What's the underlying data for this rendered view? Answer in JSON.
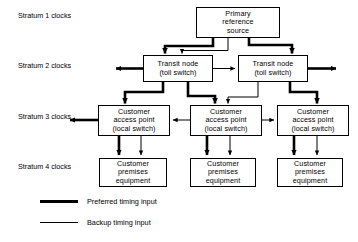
{
  "figure": {
    "background_color": "#ffffff",
    "line_color": "#000000"
  },
  "strata": [
    {
      "id": "stratum-1",
      "label_line1": "Stratum 1",
      "label_line2": "clocks",
      "x": 18,
      "y": 12
    },
    {
      "id": "stratum-2",
      "label_line1": "Stratum 2",
      "label_line2": "clocks",
      "x": 18,
      "y": 62
    },
    {
      "id": "stratum-3",
      "label_line1": "Stratum 3",
      "label_line2": "clocks",
      "x": 18,
      "y": 113
    },
    {
      "id": "stratum-4",
      "label_line1": "Stratum 4",
      "label_line2": "clocks",
      "x": 18,
      "y": 163
    }
  ],
  "nodes": [
    {
      "id": "primary-reference-source",
      "lines": [
        "Primary",
        "reference",
        "source"
      ],
      "x": 196,
      "y": 7,
      "w": 84,
      "h": 31
    },
    {
      "id": "transit-node-left",
      "lines": [
        "Transit node",
        "(toll switch)"
      ],
      "x": 143,
      "y": 55,
      "w": 70,
      "h": 27
    },
    {
      "id": "transit-node-right",
      "lines": [
        "Transit node",
        "(toll switch)"
      ],
      "x": 238,
      "y": 55,
      "w": 70,
      "h": 27
    },
    {
      "id": "customer-access-point-left",
      "lines": [
        "Customer",
        "access point",
        "(local switch)"
      ],
      "x": 98,
      "y": 105,
      "w": 72,
      "h": 31
    },
    {
      "id": "customer-access-point-center",
      "lines": [
        "Customer",
        "access point",
        "(local switch)"
      ],
      "x": 190,
      "y": 105,
      "w": 72,
      "h": 31
    },
    {
      "id": "customer-access-point-right",
      "lines": [
        "Customer",
        "access point",
        "(local switch)"
      ],
      "x": 277,
      "y": 105,
      "w": 72,
      "h": 31
    },
    {
      "id": "customer-premises-equipment-left",
      "lines": [
        "Customer",
        "premises",
        "equipment"
      ],
      "x": 99,
      "y": 158,
      "w": 68,
      "h": 29
    },
    {
      "id": "customer-premises-equipment-center",
      "lines": [
        "Customer",
        "premises",
        "equipment"
      ],
      "x": 190,
      "y": 158,
      "w": 66,
      "h": 29
    },
    {
      "id": "customer-premises-equipment-right",
      "lines": [
        "Customer",
        "premises",
        "equipment"
      ],
      "x": 277,
      "y": 158,
      "w": 66,
      "h": 29
    }
  ],
  "legend": {
    "items": [
      {
        "id": "preferred-timing-input",
        "label": "Preferred timing input",
        "style": "thick",
        "x": 40,
        "y": 199
      },
      {
        "id": "backup-timing-input",
        "label": "Backup timing input",
        "style": "thin",
        "x": 40,
        "y": 220
      }
    ]
  }
}
